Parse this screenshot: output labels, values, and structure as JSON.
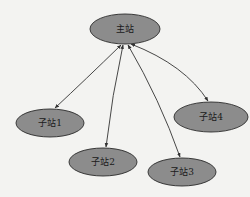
{
  "diagram": {
    "type": "star-topology",
    "colors": {
      "background": "#f3f3f1",
      "node_fill": "#8c8c8c",
      "node_stroke": "#2a2a2a",
      "edge": "#333333"
    },
    "nodes": [
      {
        "id": "master",
        "label": "主站",
        "cx": 125,
        "cy": 29,
        "rx": 35,
        "ry": 15
      },
      {
        "id": "sub1",
        "label": "子站1",
        "cx": 50,
        "cy": 123,
        "rx": 34,
        "ry": 14
      },
      {
        "id": "sub2",
        "label": "子站2",
        "cx": 103,
        "cy": 162,
        "rx": 34,
        "ry": 14
      },
      {
        "id": "sub3",
        "label": "子站3",
        "cx": 182,
        "cy": 172,
        "rx": 34,
        "ry": 14
      },
      {
        "id": "sub4",
        "label": "子站4",
        "cx": 211,
        "cy": 117,
        "rx": 37,
        "ry": 15
      }
    ],
    "edges": [
      {
        "from": "master",
        "to": "sub1",
        "direction": "bidirectional"
      },
      {
        "from": "master",
        "to": "sub2",
        "direction": "bidirectional"
      },
      {
        "from": "master",
        "to": "sub3",
        "direction": "bidirectional"
      },
      {
        "from": "master",
        "to": "sub4",
        "direction": "bidirectional"
      }
    ]
  }
}
